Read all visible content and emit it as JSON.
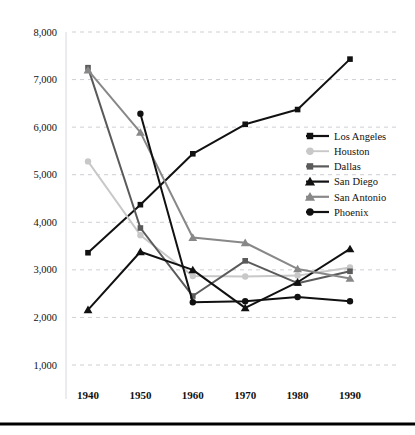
{
  "chart_data": {
    "type": "line",
    "title": "",
    "xlabel": "",
    "ylabel": "",
    "x": [
      1940,
      1950,
      1960,
      1970,
      1980,
      1990
    ],
    "categories": [
      "1940",
      "1950",
      "1960",
      "1970",
      "1980",
      "1990"
    ],
    "xtick_labels": [
      "1940",
      "1950",
      "1960",
      "1970",
      "1980",
      "1990"
    ],
    "ytick_labels": [
      "8,000",
      "7,000",
      "6,000",
      "5,000",
      "4,000",
      "3,000",
      "2,000",
      "1,000"
    ],
    "ytick_values": [
      8000,
      7000,
      6000,
      5000,
      4000,
      3000,
      2000,
      1000
    ],
    "ylim": [
      1000,
      8000
    ],
    "grid": true,
    "legend_position": "center-right",
    "series": [
      {
        "name": "Los Angeles",
        "marker": "square",
        "color": "#111111",
        "values": [
          3360,
          4370,
          5440,
          6060,
          6370,
          7430
        ]
      },
      {
        "name": "Houston",
        "marker": "circle",
        "color": "#c8c8c8",
        "values": [
          5280,
          3730,
          2870,
          2860,
          2880,
          3050
        ]
      },
      {
        "name": "Dallas",
        "marker": "square",
        "color": "#5a5a5a",
        "values": [
          7250,
          3880,
          2450,
          3190,
          2720,
          2970
        ]
      },
      {
        "name": "San Diego",
        "marker": "triangle",
        "color": "#111111",
        "values": [
          2160,
          3380,
          3000,
          2200,
          2740,
          3440
        ]
      },
      {
        "name": "San Antonio",
        "marker": "triangle",
        "color": "#888888",
        "values": [
          7200,
          5890,
          3680,
          3570,
          3020,
          2820
        ]
      },
      {
        "name": "Phoenix",
        "marker": "circle",
        "color": "#111111",
        "values": [
          null,
          6280,
          2320,
          2340,
          2430,
          2340
        ]
      }
    ]
  },
  "legend": {
    "entries": [
      {
        "label": "Los Angeles"
      },
      {
        "label": "Houston"
      },
      {
        "label": "Dallas"
      },
      {
        "label": "San Diego"
      },
      {
        "label": "San Antonio"
      },
      {
        "label": "Phoenix"
      }
    ]
  },
  "colors": {
    "background": "#ffffff",
    "gridline": "#cfcfd4",
    "text": "#111111",
    "baseline": "#000000"
  }
}
